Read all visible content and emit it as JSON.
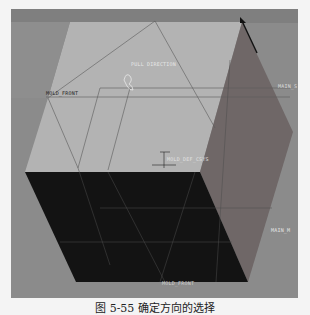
{
  "viewport": {
    "background": "#8b8b8b",
    "planes": {
      "top_plane_color": "#b4b4b4",
      "bottom_plane_color": "#141414",
      "side_plane_color": "#6e6464"
    },
    "labels": {
      "pull_direction": "PULL DIRECTION",
      "mold_front_left": "MOLD_FRONT",
      "main_side_right": "MAIN_S",
      "mold_def_csys": "MOLD_DEF_CSYS",
      "main_m_right": "MAIN_M",
      "mold_front_bottom": "MOLD_FRONT"
    },
    "arrow_color": "#111111"
  },
  "caption": "图 5-55  确定方向的选择"
}
